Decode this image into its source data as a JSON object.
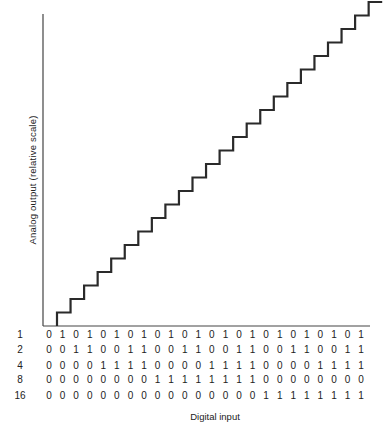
{
  "chart_data": {
    "type": "line",
    "subtype": "staircase",
    "title": "",
    "xlabel": "Digital input",
    "ylabel": "Analog output (relative scale)",
    "x": [
      0,
      1,
      2,
      3,
      4,
      5,
      6,
      7,
      8,
      9,
      10,
      11,
      12,
      13,
      14,
      15,
      16,
      17,
      18,
      19,
      20,
      21,
      22,
      23
    ],
    "series": [
      {
        "name": "Analog output",
        "values": [
          0,
          1,
          2,
          3,
          4,
          5,
          6,
          7,
          8,
          9,
          10,
          11,
          12,
          13,
          14,
          15,
          16,
          17,
          18,
          19,
          20,
          21,
          22,
          23
        ]
      }
    ],
    "bit_table": {
      "row_labels": [
        "1",
        "2",
        "4",
        "8",
        "16"
      ],
      "rows": [
        [
          0,
          1,
          0,
          1,
          0,
          1,
          0,
          1,
          0,
          1,
          0,
          1,
          0,
          1,
          0,
          1,
          0,
          1,
          0,
          1,
          0,
          1,
          0,
          1
        ],
        [
          0,
          0,
          1,
          1,
          0,
          0,
          1,
          1,
          0,
          0,
          1,
          1,
          0,
          0,
          1,
          1,
          0,
          0,
          1,
          1,
          0,
          0,
          1,
          1
        ],
        [
          0,
          0,
          0,
          0,
          1,
          1,
          1,
          1,
          0,
          0,
          0,
          0,
          1,
          1,
          1,
          1,
          0,
          0,
          0,
          0,
          1,
          1,
          1,
          1
        ],
        [
          0,
          0,
          0,
          0,
          0,
          0,
          0,
          0,
          1,
          1,
          1,
          1,
          1,
          1,
          1,
          1,
          0,
          0,
          0,
          0,
          0,
          0,
          0,
          0
        ],
        [
          0,
          0,
          0,
          0,
          0,
          0,
          0,
          0,
          0,
          0,
          0,
          0,
          0,
          0,
          0,
          0,
          1,
          1,
          1,
          1,
          1,
          1,
          1,
          1
        ]
      ]
    },
    "grid": false,
    "legend": "none",
    "line_color": "#2a2a2a"
  },
  "labels": {
    "ylabel": "Analog output (relative scale)",
    "xlabel": "Digital input"
  }
}
